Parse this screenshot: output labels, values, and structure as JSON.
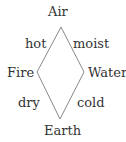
{
  "diagram": {
    "nodes": [
      {
        "id": "air",
        "label": "Air"
      },
      {
        "id": "fire",
        "label": "Fire"
      },
      {
        "id": "water",
        "label": "Water"
      },
      {
        "id": "earth",
        "label": "Earth"
      }
    ],
    "edges": [
      {
        "from": "air",
        "to": "fire",
        "label": "hot"
      },
      {
        "from": "air",
        "to": "water",
        "label": "moist"
      },
      {
        "from": "fire",
        "to": "earth",
        "label": "dry"
      },
      {
        "from": "water",
        "to": "earth",
        "label": "cold"
      }
    ],
    "colors": {
      "line": "#888888",
      "text": "#333333"
    }
  }
}
